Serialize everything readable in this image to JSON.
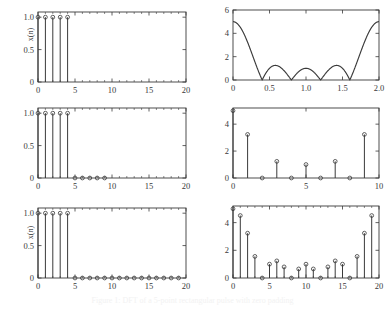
{
  "figure": {
    "caption": "Figure 1: DFT of a 5-point rectangular pulse with zero padding",
    "background": "#ffffff",
    "line_color": "#3a3a3a",
    "axis_color": "#3a3a3a"
  },
  "chart_data": [
    {
      "id": "panel-1-1",
      "position": "top-left",
      "type": "stem",
      "title": "",
      "xlabel": "",
      "ylabel": "x(n)",
      "x": [
        0,
        1,
        2,
        3,
        4
      ],
      "values": [
        1,
        1,
        1,
        1,
        1
      ],
      "xlim": [
        0,
        20
      ],
      "ylim": [
        0,
        1.08
      ],
      "xticks": [
        0,
        5,
        10,
        15,
        20
      ],
      "xticklabels": [
        "0",
        "5",
        "10",
        "15",
        "20"
      ],
      "yticks": [
        0,
        0.5,
        1.0
      ],
      "yticklabels": [
        "0",
        "0.5",
        "1.0"
      ],
      "grid": false,
      "marker": "circle",
      "legend": "none"
    },
    {
      "id": "panel-1-2",
      "position": "top-right",
      "type": "line",
      "title": "",
      "xlabel": "",
      "ylabel": "|X(e^{jw})|",
      "ylabel_html": "|X(e<sup>jw</sup>)|",
      "xlim": [
        0,
        2
      ],
      "ylim": [
        0,
        6
      ],
      "xticks": [
        0,
        0.5,
        1.0,
        1.5,
        2.0
      ],
      "xticklabels": [
        "0",
        "0.5",
        "1.0",
        "1.5",
        "2.0"
      ],
      "yticks": [
        0,
        2,
        4,
        6
      ],
      "yticklabels": [
        "0",
        "2",
        "4",
        "6"
      ],
      "grid": false,
      "legend": "none",
      "description": "Dirichlet kernel magnitude |sin(5*pi*x/2)/sin(pi*x/2)| for a 5-point rectangular pulse",
      "nulls": [
        0.4,
        0.8,
        1.2,
        1.6
      ],
      "peak_value": 5,
      "sidelobe_peaks": [
        1.24,
        1.0,
        1.24
      ],
      "samples_x": [
        0,
        0.04,
        0.08,
        0.12,
        0.16,
        0.2,
        0.24,
        0.28,
        0.32,
        0.36,
        0.4,
        0.44,
        0.48,
        0.52,
        0.56,
        0.6,
        0.64,
        0.68,
        0.72,
        0.76,
        0.8,
        0.84,
        0.88,
        0.92,
        0.96,
        1.0,
        1.04,
        1.08,
        1.12,
        1.16,
        1.2,
        1.24,
        1.28,
        1.32,
        1.36,
        1.4,
        1.44,
        1.48,
        1.52,
        1.56,
        1.6,
        1.64,
        1.68,
        1.72,
        1.76,
        1.8,
        1.84,
        1.88,
        1.92,
        1.96,
        2.0
      ]
    },
    {
      "id": "panel-2-1",
      "position": "middle-left",
      "type": "stem",
      "title": "",
      "xlabel": "",
      "ylabel": "x(n)",
      "x": [
        0,
        1,
        2,
        3,
        4,
        5,
        6,
        7,
        8,
        9
      ],
      "values": [
        1,
        1,
        1,
        1,
        1,
        0,
        0,
        0,
        0,
        0
      ],
      "xlim": [
        0,
        20
      ],
      "ylim": [
        0,
        1.08
      ],
      "xticks": [
        0,
        5,
        10,
        15,
        20
      ],
      "xticklabels": [
        "0",
        "5",
        "10",
        "15",
        "20"
      ],
      "yticks": [
        0,
        0.5,
        1.0
      ],
      "yticklabels": [
        "0",
        "0.5",
        "1.0"
      ],
      "grid": false,
      "marker": "circle",
      "legend": "none"
    },
    {
      "id": "panel-2-2",
      "position": "middle-right",
      "type": "stem",
      "title": "",
      "xlabel": "",
      "ylabel": "|X(k)|",
      "x": [
        0,
        1,
        2,
        3,
        4,
        5,
        6,
        7,
        8,
        9
      ],
      "values": [
        5,
        3.236,
        0,
        1.236,
        0,
        1,
        0,
        1.236,
        0,
        3.236
      ],
      "xlim": [
        0,
        10
      ],
      "ylim": [
        0,
        5.2
      ],
      "xticks": [
        0,
        5,
        10
      ],
      "xticklabels": [
        "0",
        "5",
        "10"
      ],
      "yticks": [
        0,
        2,
        4
      ],
      "yticklabels": [
        "0",
        "2",
        "4"
      ],
      "grid": false,
      "marker": "circle",
      "legend": "none"
    },
    {
      "id": "panel-3-1",
      "position": "bottom-left",
      "type": "stem",
      "title": "",
      "xlabel": "",
      "ylabel": "x(n)",
      "x": [
        0,
        1,
        2,
        3,
        4,
        5,
        6,
        7,
        8,
        9,
        10,
        11,
        12,
        13,
        14,
        15,
        16,
        17,
        18,
        19
      ],
      "values": [
        1,
        1,
        1,
        1,
        1,
        0,
        0,
        0,
        0,
        0,
        0,
        0,
        0,
        0,
        0,
        0,
        0,
        0,
        0,
        0
      ],
      "xlim": [
        0,
        20
      ],
      "ylim": [
        0,
        1.08
      ],
      "xticks": [
        0,
        5,
        10,
        15,
        20
      ],
      "xticklabels": [
        "0",
        "5",
        "10",
        "15",
        "20"
      ],
      "yticks": [
        0,
        0.5,
        1.0
      ],
      "yticklabels": [
        "0",
        "0.5",
        "1.0"
      ],
      "grid": false,
      "marker": "circle",
      "legend": "none"
    },
    {
      "id": "panel-3-2",
      "position": "bottom-right",
      "type": "stem",
      "title": "",
      "xlabel": "",
      "ylabel": "|X(k)|",
      "x": [
        0,
        1,
        2,
        3,
        4,
        5,
        6,
        7,
        8,
        9,
        10,
        11,
        12,
        13,
        14,
        15,
        16,
        17,
        18,
        19
      ],
      "values": [
        5,
        4.511,
        3.236,
        1.56,
        0,
        1.0,
        1.236,
        0.802,
        0,
        0.654,
        1.0,
        0.654,
        0,
        0.802,
        1.236,
        1.0,
        0,
        1.56,
        3.236,
        4.511
      ],
      "xlim": [
        0,
        20
      ],
      "ylim": [
        0,
        5.2
      ],
      "xticks": [
        0,
        5,
        10,
        15,
        20
      ],
      "xticklabels": [
        "0",
        "5",
        "10",
        "15",
        "20"
      ],
      "yticks": [
        0,
        2,
        4
      ],
      "yticklabels": [
        "0",
        "2",
        "4"
      ],
      "grid": false,
      "marker": "circle",
      "legend": "none"
    }
  ]
}
